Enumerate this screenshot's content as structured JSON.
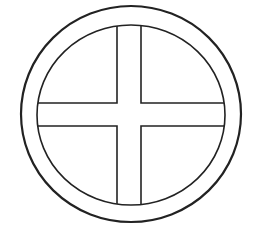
{
  "figure": {
    "description": "Circled cross symbol (sun cross / wheel cross) line drawing",
    "symbol_name": "sun-cross",
    "stroke_color": "#222222",
    "background_color": "#ffffff",
    "outer_ring": {
      "cx": 131,
      "cy": 114,
      "rx": 110,
      "ry": 108,
      "stroke_width": 2.2
    },
    "inner_ring": {
      "cx": 131,
      "cy": 115,
      "rx": 94,
      "ry": 90,
      "stroke_width": 1.6
    },
    "cross": {
      "horizontal_bar": {
        "y_top": 103,
        "y_bottom": 126
      },
      "vertical_bar": {
        "x_left": 117,
        "x_right": 141
      },
      "stroke_width": 1.6
    }
  }
}
